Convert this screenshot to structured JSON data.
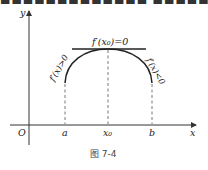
{
  "top_fragment": "■■■■■■■■■■■■■ ■■■■■■■■■■■",
  "figure": {
    "caption": "图 7-4",
    "axes": {
      "origin_label": "O",
      "x_label": "x",
      "y_label": "y"
    },
    "x_ticks": [
      "a",
      "x₀",
      "b"
    ],
    "annotations": {
      "tangent": "f′(x₀)=0",
      "left_slope": "f′(x)>0",
      "right_slope": "f′(x)<0"
    }
  }
}
